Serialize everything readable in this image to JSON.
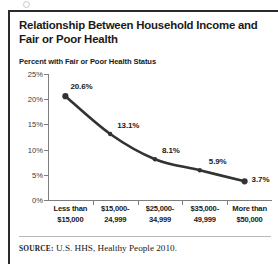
{
  "figure": {
    "title": "Relationship Between Household Income and Fair or Poor Health",
    "subtitle": "Percent with Fair or Poor Health Status",
    "source_prefix": "SOURCE:",
    "source_text": " U.S. HHS, Healthy People 2010."
  },
  "chart_data": {
    "type": "line",
    "title": "Relationship Between Household Income and Fair or Poor Health",
    "subtitle": "Percent with Fair or Poor Health Status",
    "categories": [
      "Less than $15,000",
      "$15,000-24,999",
      "$25,000-34,999",
      "$35,000-49,999",
      "More than $50,000"
    ],
    "category_lines": [
      [
        "Less than",
        "$15,000"
      ],
      [
        "$15,000-",
        "24,999"
      ],
      [
        "$25,000-",
        "34,999"
      ],
      [
        "$35,000-",
        "49,999"
      ],
      [
        "More than",
        "$50,000"
      ]
    ],
    "values": [
      20.6,
      13.1,
      8.1,
      5.9,
      3.7
    ],
    "point_labels": [
      "20.6%",
      "13.1%",
      "8.1%",
      "5.9%",
      "3.7%"
    ],
    "xlabel": "",
    "ylabel": "Percent with Fair or Poor Health Status",
    "ylim": [
      0,
      25
    ],
    "yticks": [
      0,
      5,
      10,
      15,
      20,
      25
    ],
    "ytick_labels": [
      "0%",
      "5%",
      "10%",
      "15%",
      "20%",
      "25%"
    ],
    "grid": false,
    "legend": false,
    "marker": "circle",
    "line_color": "#333333",
    "marker_color": "#333333",
    "smoothed": true
  }
}
